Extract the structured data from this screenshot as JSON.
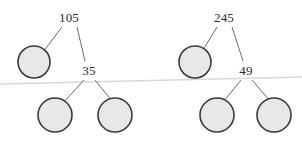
{
  "figure": {
    "type": "diagram",
    "subtype": "binary-tree",
    "width": 302,
    "height": 146,
    "background_color": "#ffffff",
    "colors": {
      "circle_fill": "#e8e8e8",
      "circle_stroke": "#3a3a3a",
      "edge_stroke": "#6e6e6e",
      "baseline_stroke": "#d8d8d8",
      "label_color": "#2b2b2b"
    },
    "baseline": {
      "name": "horizon-line",
      "x1": 0,
      "y1": 84,
      "x2": 302,
      "y2": 77
    },
    "trees": [
      {
        "name": "left-tree",
        "root": {
          "label": "105",
          "x": 69,
          "y": 18
        },
        "internal": {
          "label": "35",
          "x": 89,
          "y": 71
        },
        "leaves": [
          {
            "name": "left-tree-leaf-1",
            "cx": 34,
            "cy": 62,
            "r": 16
          },
          {
            "name": "left-tree-leaf-2",
            "cx": 55,
            "cy": 115,
            "r": 17
          },
          {
            "name": "left-tree-leaf-3",
            "cx": 115,
            "cy": 115,
            "r": 17
          }
        ]
      },
      {
        "name": "right-tree",
        "root": {
          "label": "245",
          "x": 224,
          "y": 18
        },
        "internal": {
          "label": "49",
          "x": 246,
          "y": 71
        },
        "leaves": [
          {
            "name": "right-tree-leaf-1",
            "cx": 195,
            "cy": 62,
            "r": 16
          },
          {
            "name": "right-tree-leaf-2",
            "cx": 217,
            "cy": 115,
            "r": 17
          },
          {
            "name": "right-tree-leaf-3",
            "cx": 274,
            "cy": 115,
            "r": 17
          }
        ]
      }
    ],
    "labels": {
      "left_root": "105",
      "left_internal": "35",
      "right_root": "245",
      "right_internal": "49"
    }
  }
}
